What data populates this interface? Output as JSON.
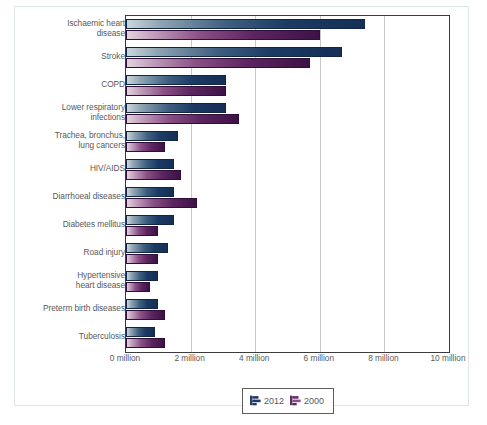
{
  "chart_data": {
    "type": "bar",
    "orientation": "horizontal",
    "title": "",
    "xlabel": "",
    "ylabel": "",
    "xlim": [
      0,
      10
    ],
    "grid": true,
    "legend_position": "bottom",
    "units": "million deaths",
    "xticks": [
      {
        "value": 0,
        "label": "0 million"
      },
      {
        "value": 2,
        "label": "2 million"
      },
      {
        "value": 4,
        "label": "4 million"
      },
      {
        "value": 6,
        "label": "6 million"
      },
      {
        "value": 8,
        "label": "8 million"
      },
      {
        "value": 10,
        "label": "10 million"
      }
    ],
    "categories": [
      "Ischaemic heart disease",
      "Stroke",
      "COPD",
      "Lower respiratory infections",
      "Trachea, bronchus, lung cancers",
      "HIV/AIDS",
      "Diarrhoeal diseases",
      "Diabetes mellitus",
      "Road injury",
      "Hypertensive heart disease",
      "Preterm birth diseases",
      "Tuberculosis"
    ],
    "category_lines": [
      [
        "Ischaemic heart",
        "disease"
      ],
      [
        "Stroke"
      ],
      [
        "COPD"
      ],
      [
        "Lower respiratory",
        "infections"
      ],
      [
        "Trachea, bronchus,",
        "lung cancers"
      ],
      [
        "HIV/AIDS"
      ],
      [
        "Diarrhoeal diseases"
      ],
      [
        "Diabetes mellitus"
      ],
      [
        "Road injury"
      ],
      [
        "Hypertensive",
        "heart disease"
      ],
      [
        "Preterm birth diseases"
      ],
      [
        "Tuberculosis"
      ]
    ],
    "series": [
      {
        "name": "2012",
        "color": "#1b3a63",
        "values": [
          7.4,
          6.7,
          3.1,
          3.1,
          1.6,
          1.5,
          1.5,
          1.5,
          1.3,
          1.0,
          1.0,
          0.9
        ]
      },
      {
        "name": "2000",
        "color": "#5d2560",
        "values": [
          6.0,
          5.7,
          3.1,
          3.5,
          1.2,
          1.7,
          2.2,
          1.0,
          1.0,
          0.75,
          1.2,
          1.2
        ]
      }
    ]
  },
  "legend": {
    "items": [
      {
        "label": "2012",
        "icon": "bar-chart-icon-blue",
        "color": "#1b3a63"
      },
      {
        "label": "2000",
        "icon": "bar-chart-icon-purple",
        "color": "#5d2560"
      }
    ]
  }
}
